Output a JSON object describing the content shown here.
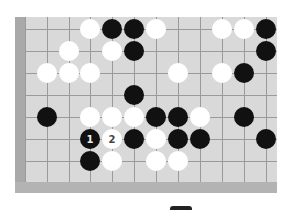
{
  "board": {
    "colors": {
      "board": "#d9d9d9",
      "edge": "#a9a9a9",
      "line": "#9a9a9a",
      "black": "#111111",
      "white": "#ffffff"
    },
    "cols_x": [
      25,
      47,
      69,
      90,
      112,
      134,
      156,
      178,
      200,
      222,
      244,
      266
    ],
    "rows_y": [
      29,
      51,
      73,
      95,
      117,
      139,
      161
    ],
    "stones": [
      {
        "c": 3,
        "r": 0,
        "color": "white"
      },
      {
        "c": 4,
        "r": 0,
        "color": "black"
      },
      {
        "c": 5,
        "r": 0,
        "color": "black"
      },
      {
        "c": 6,
        "r": 0,
        "color": "white"
      },
      {
        "c": 9,
        "r": 0,
        "color": "white"
      },
      {
        "c": 10,
        "r": 0,
        "color": "white"
      },
      {
        "c": 11,
        "r": 0,
        "color": "black"
      },
      {
        "c": 2,
        "r": 1,
        "color": "white"
      },
      {
        "c": 4,
        "r": 1,
        "color": "white"
      },
      {
        "c": 5,
        "r": 1,
        "color": "black"
      },
      {
        "c": 11,
        "r": 1,
        "color": "black"
      },
      {
        "c": 1,
        "r": 2,
        "color": "white"
      },
      {
        "c": 2,
        "r": 2,
        "color": "white"
      },
      {
        "c": 3,
        "r": 2,
        "color": "white"
      },
      {
        "c": 7,
        "r": 2,
        "color": "white"
      },
      {
        "c": 9,
        "r": 2,
        "color": "white"
      },
      {
        "c": 10,
        "r": 2,
        "color": "black"
      },
      {
        "c": 5,
        "r": 3,
        "color": "black"
      },
      {
        "c": 1,
        "r": 4,
        "color": "black"
      },
      {
        "c": 3,
        "r": 4,
        "color": "white"
      },
      {
        "c": 4,
        "r": 4,
        "color": "white"
      },
      {
        "c": 5,
        "r": 4,
        "color": "white"
      },
      {
        "c": 6,
        "r": 4,
        "color": "black"
      },
      {
        "c": 7,
        "r": 4,
        "color": "black"
      },
      {
        "c": 8,
        "r": 4,
        "color": "white"
      },
      {
        "c": 10,
        "r": 4,
        "color": "black"
      },
      {
        "c": 3,
        "r": 5,
        "color": "black",
        "label": "1"
      },
      {
        "c": 4,
        "r": 5,
        "color": "white",
        "label": "2"
      },
      {
        "c": 5,
        "r": 5,
        "color": "black"
      },
      {
        "c": 6,
        "r": 5,
        "color": "white"
      },
      {
        "c": 7,
        "r": 5,
        "color": "black"
      },
      {
        "c": 8,
        "r": 5,
        "color": "black"
      },
      {
        "c": 11,
        "r": 5,
        "color": "black"
      },
      {
        "c": 3,
        "r": 6,
        "color": "black"
      },
      {
        "c": 4,
        "r": 6,
        "color": "white"
      },
      {
        "c": 6,
        "r": 6,
        "color": "white"
      },
      {
        "c": 7,
        "r": 6,
        "color": "white"
      }
    ]
  }
}
